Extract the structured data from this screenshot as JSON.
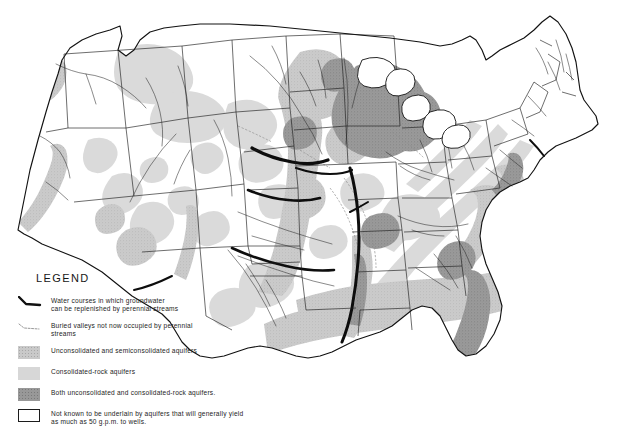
{
  "figure": {
    "kind": "thematic-map",
    "background_color": "#ffffff",
    "outline_color": "#1c1c1c"
  },
  "legend": {
    "title": "LEGEND",
    "entries": [
      {
        "key": "water-course-line",
        "symbol": "thick-black-line",
        "color": "#111111",
        "text": "Water courses in which  groundwater\ncan be replenished by perennial streams"
      },
      {
        "key": "buried-valley-line",
        "symbol": "thin-dashed-line",
        "color": "#8c8c8c",
        "text": "Buried valleys not now occupied by perennial\nstreams"
      },
      {
        "key": "unconsolidated-aquifer",
        "symbol": "stippled-light-gray-swatch",
        "color": "#c9c9c9",
        "text": "Unconsolidated and semiconsolidated  aquifers"
      },
      {
        "key": "consolidated-rock-aquifer",
        "symbol": "flat-light-gray-swatch",
        "color": "#d7d7d7",
        "text": "Consolidated-rock  aquifers"
      },
      {
        "key": "both-aquifer-types",
        "symbol": "stippled-dark-gray-swatch",
        "color": "#989898",
        "text": "Both unconsolidated and  consolidated-rock aquifers."
      },
      {
        "key": "no-known-aquifer",
        "symbol": "white-outlined-swatch",
        "color": "#ffffff",
        "text": "Not known to be  underlain by aquifers that will generally yield\nas much as 50 g.p.m. to wells."
      }
    ]
  },
  "map": {
    "region_label": "Conterminous United States",
    "features": {
      "state_borders": "thin black lines",
      "rivers": "thin black drainage lines",
      "major_water_courses": "heavy black lines along the Platte, Arkansas, Mississippi and Rio Grande corridors",
      "shaded_regions": [
        "Coastal Plain (Atlantic and Gulf) — unconsolidated and semiconsolidated",
        "Florida peninsula — both unconsolidated and consolidated-rock",
        "Great Lakes / upper Midwest — both unconsolidated and consolidated-rock",
        "High Plains / Ogallala belt — unconsolidated and semiconsolidated",
        "Columbia Plateau and Snake River Plain — consolidated-rock",
        "Basin and Range valley fill — unconsolidated",
        "Appalachian belt — consolidated-rock"
      ]
    }
  }
}
